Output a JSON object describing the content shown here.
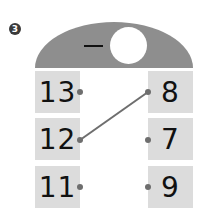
{
  "problem_number": "3",
  "header": {
    "operator": "−",
    "blank": ""
  },
  "left_column": [
    {
      "value": "13"
    },
    {
      "value": "12"
    },
    {
      "value": "11"
    }
  ],
  "right_column": [
    {
      "value": "8"
    },
    {
      "value": "7"
    },
    {
      "value": "9"
    }
  ],
  "connections": [
    {
      "from": "12",
      "to": "8"
    }
  ],
  "colors": {
    "dome": "#8e8e8e",
    "box": "#dcdcdc",
    "dot": "#6e6e6e",
    "line": "#6e6e6e"
  }
}
